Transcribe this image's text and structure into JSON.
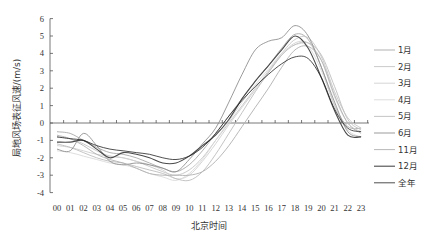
{
  "chart_data": {
    "type": "line",
    "title": "",
    "xlabel": "北京时间",
    "ylabel": "局地风场表征风速/(m/s)",
    "ylim": [
      -4,
      6
    ],
    "yticks": [
      6,
      5,
      4,
      3,
      2,
      1,
      0,
      -1,
      -2,
      -3,
      -4
    ],
    "grid": false,
    "legend_position": "right",
    "categories": [
      "00",
      "01",
      "02",
      "03",
      "04",
      "05",
      "06",
      "07",
      "08",
      "09",
      "10",
      "11",
      "12",
      "13",
      "14",
      "15",
      "16",
      "17",
      "18",
      "19",
      "20",
      "21",
      "22",
      "23"
    ],
    "series": [
      {
        "name": "1月",
        "color": "#a8a8a8",
        "width": 0.9,
        "values": [
          -0.5,
          -0.6,
          -1.0,
          -1.4,
          -1.7,
          -1.8,
          -2.0,
          -2.3,
          -2.6,
          -2.8,
          -2.4,
          -1.6,
          -0.6,
          0.4,
          1.4,
          2.4,
          3.3,
          4.3,
          5.1,
          4.8,
          3.2,
          1.0,
          -0.2,
          -0.3
        ]
      },
      {
        "name": "2月",
        "color": "#c4c4c4",
        "width": 0.9,
        "values": [
          -0.8,
          -0.9,
          -1.2,
          -1.6,
          -1.9,
          -2.0,
          -2.2,
          -2.5,
          -2.8,
          -3.0,
          -2.7,
          -2.0,
          -1.0,
          0.0,
          1.0,
          2.0,
          3.0,
          4.0,
          4.8,
          4.9,
          3.8,
          1.8,
          0.3,
          -0.3
        ]
      },
      {
        "name": "3月",
        "color": "#d0d0d0",
        "width": 0.9,
        "values": [
          -1.3,
          -1.4,
          -1.6,
          -1.8,
          -1.9,
          -2.0,
          -2.2,
          -2.4,
          -2.7,
          -3.2,
          -3.0,
          -2.2,
          -1.2,
          -0.1,
          0.9,
          1.9,
          2.9,
          3.9,
          4.6,
          4.6,
          3.6,
          1.5,
          0.0,
          -0.5
        ]
      },
      {
        "name": "4月",
        "color": "#dadada",
        "width": 0.9,
        "values": [
          -1.6,
          -1.7,
          -1.9,
          -2.1,
          -2.3,
          -2.4,
          -2.6,
          -2.9,
          -3.1,
          -3.3,
          -2.9,
          -2.1,
          -1.0,
          0.1,
          1.2,
          2.2,
          3.1,
          4.0,
          4.5,
          4.4,
          3.0,
          1.0,
          -0.4,
          -0.8
        ]
      },
      {
        "name": "5月",
        "color": "#bdbdbd",
        "width": 0.9,
        "values": [
          -1.2,
          -1.4,
          -1.7,
          -2.0,
          -2.2,
          -2.3,
          -2.5,
          -2.7,
          -2.9,
          -3.2,
          -3.3,
          -2.8,
          -1.8,
          -0.6,
          0.6,
          1.8,
          2.9,
          3.9,
          4.5,
          4.6,
          3.9,
          2.1,
          0.2,
          -0.4
        ]
      },
      {
        "name": "6月",
        "color": "#909090",
        "width": 0.9,
        "values": [
          -1.5,
          -1.6,
          -0.6,
          -1.3,
          -2.2,
          -2.4,
          -2.3,
          -2.4,
          -2.6,
          -2.8,
          -2.1,
          -1.2,
          -0.3,
          1.2,
          2.8,
          4.2,
          4.7,
          4.9,
          5.6,
          5.0,
          3.2,
          1.2,
          -0.5,
          -0.8
        ]
      },
      {
        "name": "11月",
        "color": "#b0b0b0",
        "width": 0.9,
        "values": [
          -0.7,
          -0.9,
          -1.3,
          -1.8,
          -2.1,
          -2.3,
          -2.6,
          -2.9,
          -3.0,
          -3.0,
          -3.0,
          -2.8,
          -2.2,
          -1.3,
          -0.2,
          0.9,
          2.0,
          3.2,
          4.2,
          4.4,
          3.6,
          1.6,
          0.0,
          -0.6
        ]
      },
      {
        "name": "12月",
        "color": "#4a4a4a",
        "width": 1.1,
        "values": [
          -1.1,
          -1.1,
          -1.0,
          -1.5,
          -2.0,
          -1.7,
          -1.8,
          -2.0,
          -2.3,
          -2.3,
          -1.9,
          -1.3,
          -0.7,
          0.2,
          1.4,
          2.4,
          3.3,
          4.2,
          5.0,
          4.3,
          2.6,
          0.7,
          -0.7,
          -0.8
        ]
      },
      {
        "name": "全年",
        "color": "#222222",
        "width": 0.8,
        "values": [
          -0.8,
          -0.9,
          -1.0,
          -1.3,
          -1.5,
          -1.6,
          -1.7,
          -1.8,
          -2.0,
          -2.1,
          -1.9,
          -1.4,
          -0.6,
          0.4,
          1.3,
          2.1,
          2.8,
          3.4,
          3.8,
          3.7,
          2.6,
          0.8,
          -0.3,
          -0.5
        ]
      }
    ]
  },
  "legend": {
    "items": [
      "1月",
      "2月",
      "3月",
      "4月",
      "5月",
      "6月",
      "11月",
      "12月",
      "全年"
    ]
  },
  "axes": {
    "xlabel": "北京时间",
    "ylabel": "局地风场表征风速/(m/s)"
  }
}
